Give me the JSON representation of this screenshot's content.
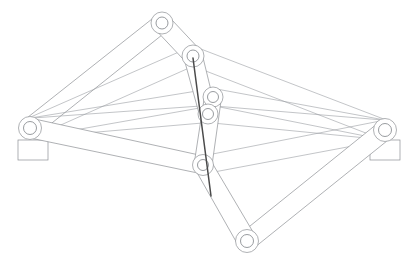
{
  "drawing": {
    "title": "Planar Multi-Link Scissor Mechanism",
    "type": "cad-line-drawing",
    "background_color": "#ffffff",
    "line_color": "#8c8f94",
    "accent_color": "#4a4a4a",
    "canvas": {
      "width": 415,
      "height": 269
    }
  },
  "joints": [
    {
      "id": "J-left-ground",
      "label": "left-ground-pivot",
      "x": 30,
      "y": 128,
      "bore_r": 6.5,
      "hub_r": 11.5
    },
    {
      "id": "J-right-ground",
      "label": "right-ground-pivot",
      "x": 385,
      "y": 130,
      "bore_r": 6.5,
      "hub_r": 11.5
    },
    {
      "id": "J-top-outer",
      "label": "upper-outer-pivot",
      "x": 162,
      "y": 23,
      "bore_r": 6.0,
      "hub_r": 11.0
    },
    {
      "id": "J-top-inner",
      "label": "upper-inner-pivot",
      "x": 193,
      "y": 56,
      "bore_r": 6.0,
      "hub_r": 11.0
    },
    {
      "id": "J-mid-upper",
      "label": "middle-upper-pivot",
      "x": 213,
      "y": 97,
      "bore_r": 5.5,
      "hub_r": 10.0
    },
    {
      "id": "J-mid-lower",
      "label": "middle-lower-pivot",
      "x": 208,
      "y": 114,
      "bore_r": 5.5,
      "hub_r": 10.0
    },
    {
      "id": "J-low-inner",
      "label": "lower-inner-pivot",
      "x": 203,
      "y": 165,
      "bore_r": 5.5,
      "hub_r": 10.5
    },
    {
      "id": "J-bottom",
      "label": "bottom-outer-pivot",
      "x": 247,
      "y": 241,
      "bore_r": 6.5,
      "hub_r": 11.5
    }
  ],
  "ground_mounts": [
    {
      "id": "M-left",
      "label": "left-base-plate",
      "x": 18,
      "y": 140,
      "w": 30,
      "h": 20
    },
    {
      "id": "M-right",
      "label": "right-base-plate",
      "x": 370,
      "y": 140,
      "w": 30,
      "h": 20
    }
  ],
  "actuator": {
    "label": "actuator-rod",
    "from_joint": "J-top-inner",
    "to_joint": "J-low-inner",
    "x1": 193,
    "y1": 58,
    "x2": 211,
    "y2": 196,
    "color": "#4a4a4a",
    "width": 1.5
  },
  "links": [
    {
      "id": "L1",
      "label": "link-left-ground-to-top-outer",
      "from": "J-left-ground",
      "to": "J-top-outer",
      "width": 9
    },
    {
      "id": "L2",
      "label": "link-left-ground-to-top-inner",
      "from": "J-left-ground",
      "to": "J-top-inner",
      "width": 5
    },
    {
      "id": "L3",
      "label": "link-left-ground-to-mid-upper",
      "from": "J-left-ground",
      "to": "J-mid-upper",
      "width": 5
    },
    {
      "id": "L4",
      "label": "link-left-ground-to-mid-lower",
      "from": "J-left-ground",
      "to": "J-mid-lower",
      "width": 5
    },
    {
      "id": "L5",
      "label": "link-left-ground-to-low-inner",
      "from": "J-left-ground",
      "to": "J-low-inner",
      "width": 9
    },
    {
      "id": "L6",
      "label": "link-right-ground-to-top-inner",
      "from": "J-right-ground",
      "to": "J-top-inner",
      "width": 5
    },
    {
      "id": "L7",
      "label": "link-right-ground-to-mid-upper",
      "from": "J-right-ground",
      "to": "J-mid-upper",
      "width": 5
    },
    {
      "id": "L8",
      "label": "link-right-ground-to-mid-lower",
      "from": "J-right-ground",
      "to": "J-mid-lower",
      "width": 5
    },
    {
      "id": "L9",
      "label": "link-right-ground-to-low-inner",
      "from": "J-right-ground",
      "to": "J-low-inner",
      "width": 6
    },
    {
      "id": "L10",
      "label": "link-right-ground-to-bottom",
      "from": "J-right-ground",
      "to": "J-bottom",
      "width": 9
    },
    {
      "id": "L11",
      "label": "link-low-inner-to-bottom",
      "from": "J-low-inner",
      "to": "J-bottom",
      "width": 11
    },
    {
      "id": "L12",
      "label": "link-top-outer-to-top-inner",
      "from": "J-top-outer",
      "to": "J-top-inner",
      "width": 11
    },
    {
      "id": "L13",
      "label": "link-top-inner-to-mid-lower",
      "from": "J-top-inner",
      "to": "J-mid-lower",
      "width": 11
    },
    {
      "id": "L14",
      "label": "link-mid-upper-to-low-inner",
      "from": "J-mid-upper",
      "to": "J-low-inner",
      "width": 10
    }
  ]
}
